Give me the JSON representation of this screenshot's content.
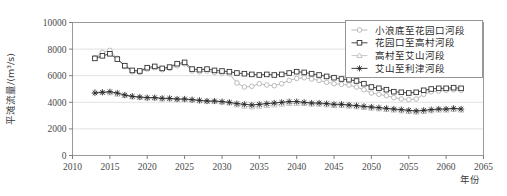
{
  "chart_data": {
    "type": "line",
    "title": "",
    "xlabel": "年份",
    "ylabel": "平滩流量/(m³/s)",
    "xlim": [
      2010,
      2065
    ],
    "ylim": [
      0,
      10000
    ],
    "xticks": [
      2010,
      2015,
      2020,
      2025,
      2030,
      2035,
      2040,
      2045,
      2050,
      2055,
      2060,
      2065
    ],
    "yticks": [
      0,
      2000,
      4000,
      6000,
      8000,
      10000
    ],
    "grid": true,
    "grid_axis": "y",
    "legend_position": "top-right",
    "x": [
      2013,
      2014,
      2015,
      2016,
      2017,
      2018,
      2019,
      2020,
      2021,
      2022,
      2023,
      2024,
      2025,
      2026,
      2027,
      2028,
      2029,
      2030,
      2031,
      2032,
      2033,
      2034,
      2035,
      2036,
      2037,
      2038,
      2039,
      2040,
      2041,
      2042,
      2043,
      2044,
      2045,
      2046,
      2047,
      2048,
      2049,
      2050,
      2051,
      2052,
      2053,
      2054,
      2055,
      2056,
      2057,
      2058,
      2059,
      2060,
      2061,
      2062
    ],
    "series": [
      {
        "name": "小浪底至花园口河段",
        "marker": "circle",
        "color": "#b3b3b3",
        "values": [
          7350,
          7750,
          7900,
          7300,
          6700,
          6300,
          6250,
          6500,
          6600,
          6450,
          6550,
          6750,
          6900,
          6350,
          6300,
          6350,
          6250,
          6200,
          6150,
          5450,
          5150,
          5200,
          5400,
          5300,
          5250,
          5400,
          5650,
          5800,
          5850,
          5750,
          5650,
          5500,
          5400,
          5350,
          5300,
          5150,
          4950,
          4700,
          4600,
          4500,
          4350,
          4250,
          4200,
          4250,
          4600,
          4800,
          4850,
          4900,
          4950,
          4900
        ]
      },
      {
        "name": "花园口至高村河段",
        "marker": "square",
        "color": "#333333",
        "values": [
          7300,
          7500,
          7650,
          7250,
          6750,
          6400,
          6350,
          6600,
          6700,
          6550,
          6650,
          6900,
          7000,
          6500,
          6450,
          6500,
          6400,
          6350,
          6300,
          6200,
          6150,
          6100,
          6050,
          6100,
          6050,
          6100,
          6200,
          6300,
          6250,
          6150,
          6050,
          5950,
          5850,
          5750,
          5700,
          5600,
          5400,
          5150,
          5050,
          4950,
          4800,
          4750,
          4700,
          4750,
          4900,
          5000,
          5050,
          5050,
          5100,
          5050
        ]
      },
      {
        "name": "高村至艾山河段",
        "marker": "triangle",
        "color": "#bfbfbf",
        "values": [
          4800,
          4750,
          4700,
          4600,
          4500,
          4400,
          4350,
          4300,
          4300,
          4250,
          4250,
          4200,
          4200,
          4150,
          4100,
          4050,
          4050,
          4000,
          3950,
          3800,
          3700,
          3650,
          3700,
          3750,
          3800,
          3850,
          3900,
          3900,
          3900,
          3850,
          3850,
          3800,
          3750,
          3750,
          3700,
          3650,
          3600,
          3550,
          3500,
          3450,
          3400,
          3350,
          3300,
          3250,
          3300,
          3350,
          3400,
          3400,
          3450,
          3400
        ]
      },
      {
        "name": "艾山至利津河段",
        "marker": "star",
        "color": "#2b2b2b",
        "values": [
          4700,
          4750,
          4800,
          4700,
          4550,
          4450,
          4400,
          4350,
          4350,
          4300,
          4300,
          4250,
          4250,
          4200,
          4150,
          4100,
          4100,
          4050,
          4000,
          3900,
          3850,
          3800,
          3850,
          3900,
          3950,
          4000,
          4050,
          4050,
          4000,
          3950,
          3950,
          3900,
          3850,
          3850,
          3800,
          3750,
          3700,
          3650,
          3600,
          3550,
          3500,
          3450,
          3400,
          3350,
          3400,
          3450,
          3500,
          3500,
          3550,
          3500
        ]
      }
    ]
  }
}
